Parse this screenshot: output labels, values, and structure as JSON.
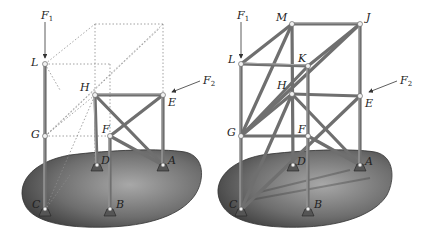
{
  "figure": {
    "left_panel": {
      "description": "Partial frame with dashed phantom outline",
      "labels": {
        "F1": "F",
        "F1_sub": "1",
        "F2": "F",
        "F2_sub": "2",
        "L": "L",
        "G": "G",
        "H": "H",
        "E": "E",
        "F": "F",
        "D": "D",
        "A": "A",
        "C": "C",
        "B": "B"
      }
    },
    "right_panel": {
      "description": "Complete space truss",
      "labels": {
        "F1": "F",
        "F1_sub": "1",
        "F2": "F",
        "F2_sub": "2",
        "M": "M",
        "J": "J",
        "L": "L",
        "K": "K",
        "H": "H",
        "E": "E",
        "G": "G",
        "F": "F",
        "D": "D",
        "A": "A",
        "C": "C",
        "B": "B"
      }
    },
    "colors": {
      "member": "#7a7a7a",
      "member_dark": "#4a4a4a",
      "ground_light": "#9a9a9a",
      "ground_dark": "#3e3e3e",
      "dashed": "#8a8a8a",
      "joint": "#f2f2f2"
    }
  }
}
